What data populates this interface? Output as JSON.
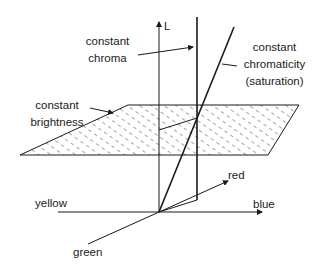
{
  "diagram": {
    "colors": {
      "line": "#1a1a1a",
      "hatch": "#333333",
      "background": "#ffffff"
    },
    "axes": {
      "L": "L",
      "yellow": "yellow",
      "blue": "blue",
      "red": "red",
      "green": "green"
    },
    "labels": {
      "constant_chroma": [
        "constant",
        "chroma"
      ],
      "constant_chromaticity": [
        "constant",
        "chromaticity",
        "(saturation)"
      ],
      "constant_brightness": [
        "constant",
        "brightness"
      ]
    }
  }
}
